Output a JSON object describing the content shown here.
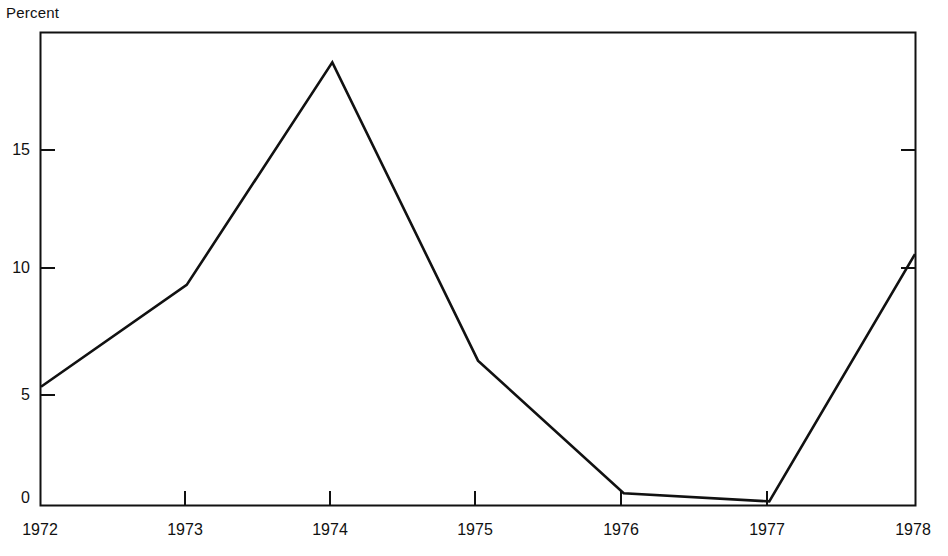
{
  "chart_data": {
    "type": "line",
    "title": "",
    "ylabel": "Percent",
    "xlabel": "",
    "x": [
      1972,
      1973,
      1974,
      1975,
      1976,
      1977,
      1978
    ],
    "values": [
      5.0,
      9.3,
      18.7,
      6.1,
      0.5,
      0.15,
      10.6
    ],
    "series": [
      {
        "name": "Percent",
        "values": [
          5.0,
          9.3,
          18.7,
          6.1,
          0.5,
          0.15,
          10.6
        ]
      }
    ],
    "categories": [
      "1972",
      "1973",
      "1974",
      "1975",
      "1976",
      "1977",
      "1978"
    ],
    "xlim": [
      1972,
      1978
    ],
    "ylim": [
      0,
      20
    ],
    "y_ticks": [
      0,
      5,
      10,
      15
    ],
    "y_tick_labels": [
      "0",
      "5",
      "10",
      "15"
    ],
    "x_ticks": [
      1972,
      1973,
      1974,
      1975,
      1976,
      1977,
      1978
    ],
    "x_tick_labels": [
      "1972",
      "1973",
      "1974",
      "1975",
      "1976",
      "1977",
      "1978"
    ],
    "grid": false,
    "legend": "none",
    "line_color": "#111111",
    "frame_color": "#111111",
    "background_color": "#ffffff"
  },
  "axis": {
    "y_title": "Percent",
    "y_labels": {
      "t15": "15",
      "t10": "10",
      "t5": "5",
      "t0": "0"
    },
    "x_labels": {
      "y1972": "1972",
      "y1973": "1973",
      "y1974": "1974",
      "y1975": "1975",
      "y1976": "1976",
      "y1977": "1977",
      "y1978": "1978"
    }
  }
}
